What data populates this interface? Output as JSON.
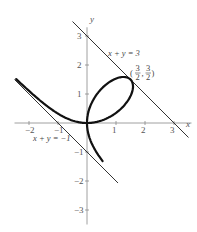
{
  "chart_data": {
    "type": "line",
    "title": "",
    "curve": "x^3 + y^3 = 3xy",
    "xlabel": "x",
    "ylabel": "y",
    "xlim": [
      -2.5,
      3.5
    ],
    "ylim": [
      -3.5,
      3.3
    ],
    "x_ticks": [
      -2,
      -1,
      1,
      2,
      3
    ],
    "y_ticks": [
      -3,
      -2,
      -1,
      1,
      2,
      3
    ],
    "x_tick_labels": [
      "−2",
      "−1",
      "1",
      "2",
      "3"
    ],
    "y_tick_labels": [
      "−3",
      "−2",
      "−1",
      "1",
      "2",
      "3"
    ],
    "grid": false,
    "series": [
      {
        "name": "folium",
        "kind": "parametric",
        "x": "3t/(1+t^3)",
        "y": "3t^2/(1+t^3)",
        "t_range_a": [
          -0.62,
          -2.4
        ],
        "t_range_b": [
          -0.42,
          60
        ],
        "color": "#111111",
        "width": 2.2
      },
      {
        "name": "x + y = 3",
        "kind": "line",
        "from": [
          -0.5,
          3.5
        ],
        "to": [
          3.5,
          -0.5
        ],
        "color": "#333333",
        "width": 1
      },
      {
        "name": "x + y = −1",
        "kind": "line",
        "from": [
          -2.5,
          1.5
        ],
        "to": [
          1.07,
          -2.07
        ],
        "color": "#333333",
        "width": 1
      }
    ],
    "annotations": [
      {
        "text": "x + y = 3",
        "x": 0.75,
        "y": 2.4
      },
      {
        "text": "x + y = −1",
        "x": -1.75,
        "y": -0.6
      },
      {
        "text": "(3/2, 3/2)",
        "x": 1.55,
        "y": 1.7,
        "point": [
          1.5,
          1.5
        ]
      }
    ]
  },
  "labels": {
    "x_axis": "x",
    "y_axis": "y",
    "line1": "x + y = 3",
    "line2": "x + y = −1",
    "point_num": "3",
    "point_den": "2"
  }
}
